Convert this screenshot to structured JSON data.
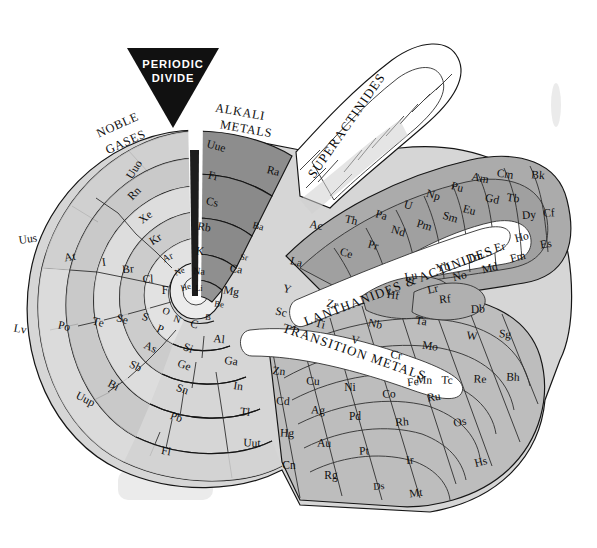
{
  "figure": {
    "divide_label_line1": "PERIODIC",
    "divide_label_line2": "DIVIDE"
  },
  "group_labels": {
    "noble_gases_line1": "NOBLE",
    "noble_gases_line2": "GASES",
    "alkali_line1": "ALKALI",
    "alkali_line2": "METALS",
    "superactinides": "SUPERACTINIDES",
    "lanthanides_actinides": "LANTHANIDES & ACTINIDES",
    "transition_metals": "TRANSITION METALS"
  },
  "colors": {
    "background": "#ffffff",
    "outline": "#151515",
    "divide_wedge": "#1a1a1a",
    "alkali_shade": "#8c8c8c",
    "noble_shade": "#cfcfcf",
    "halogen_shade": "#e2e2e2",
    "chalcogen_shade": "#b5b5b5",
    "transition_shade": "#bdbdbd",
    "lanth_shade": "#a8a8a8",
    "white_cell": "#ffffff",
    "label_band": "#ffffff"
  },
  "spiral_rings": {
    "noble_gases": [
      "Uuo",
      "Rn",
      "Xe",
      "Kr",
      "Ar",
      "Ne",
      "He"
    ],
    "alkali_metals": [
      "Uue",
      "Fr",
      "Cs",
      "Rb",
      "K",
      "Na",
      "Li"
    ],
    "halogens": [
      "Uus",
      "At",
      "I",
      "Br",
      "Cl",
      "F"
    ],
    "chalcogens": [
      "Lv",
      "Po",
      "Te",
      "Se",
      "S",
      "O"
    ],
    "pnictogens": [
      "Uup",
      "Bi",
      "Sb",
      "As",
      "P",
      "N"
    ],
    "group14": [
      "Fl",
      "Pb",
      "Sn",
      "Ge",
      "Si",
      "C"
    ],
    "group13": [
      "Uut",
      "Tl",
      "In",
      "Ga",
      "Al",
      "B"
    ],
    "alkaline_earth": [
      "Ra",
      "Ba",
      "Sr",
      "Ca",
      "Mg",
      "Be"
    ],
    "group3": [
      "Ac",
      "La",
      "Y",
      "Sc"
    ],
    "group12": [
      "Cn",
      "Hg",
      "Cd",
      "Zn"
    ],
    "group4": [
      "Rf",
      "Hf",
      "Zr",
      "Ti"
    ],
    "group11": [
      "Rg",
      "Au",
      "Ag",
      "Cu"
    ],
    "group5": [
      "Db",
      "Ta",
      "Nb",
      "V"
    ],
    "group10": [
      "Ds",
      "Pt",
      "Pd",
      "Ni"
    ],
    "group6": [
      "Sg",
      "W",
      "Mo",
      "Cr"
    ],
    "group9": [
      "Mt",
      "Ir",
      "Rh",
      "Co"
    ],
    "group7": [
      "Bh",
      "Re",
      "Tc",
      "Mn"
    ],
    "group8": [
      "Hs",
      "Os",
      "Ru",
      "Fe"
    ]
  },
  "lanthanides": [
    "La",
    "Ce",
    "Pr",
    "Nd",
    "Pm",
    "Sm",
    "Eu",
    "Gd",
    "Tb",
    "Dy",
    "Ho",
    "Er",
    "Tm",
    "Yb",
    "Lu"
  ],
  "actinides": [
    "Ac",
    "Th",
    "Pa",
    "U",
    "Np",
    "Pu",
    "Am",
    "Cm",
    "Bk",
    "Cf",
    "Es",
    "Fm",
    "Md",
    "No",
    "Lr"
  ],
  "cells": {
    "noble": [
      {
        "t": "Uuo",
        "x": 135,
        "y": 170,
        "r": -58,
        "s": ""
      },
      {
        "t": "Rn",
        "x": 135,
        "y": 194,
        "r": -46,
        "s": ""
      },
      {
        "t": "Xe",
        "x": 146,
        "y": 218,
        "r": -38,
        "s": ""
      },
      {
        "t": "Kr",
        "x": 156,
        "y": 240,
        "r": -32,
        "s": ""
      },
      {
        "t": "Ar",
        "x": 168,
        "y": 258,
        "r": -26,
        "s": "sm"
      },
      {
        "t": "Ne",
        "x": 180,
        "y": 272,
        "r": -22,
        "s": "xs"
      },
      {
        "t": "He",
        "x": 186,
        "y": 288,
        "r": -16,
        "s": "xs"
      }
    ],
    "alkali": [
      {
        "t": "Uue",
        "x": 216,
        "y": 147,
        "r": 16,
        "s": ""
      },
      {
        "t": "Fr",
        "x": 213,
        "y": 177,
        "r": 14,
        "s": ""
      },
      {
        "t": "Cs",
        "x": 212,
        "y": 203,
        "r": 12,
        "s": ""
      },
      {
        "t": "Rb",
        "x": 204,
        "y": 228,
        "r": 10,
        "s": ""
      },
      {
        "t": "K",
        "x": 200,
        "y": 252,
        "r": 6,
        "s": ""
      },
      {
        "t": "Na",
        "x": 199,
        "y": 272,
        "r": 4,
        "s": "sm"
      },
      {
        "t": "Li",
        "x": 199,
        "y": 289,
        "r": 2,
        "s": "xs"
      }
    ],
    "halogen": [
      {
        "t": "Uus",
        "x": 28,
        "y": 240,
        "r": -8,
        "s": ""
      },
      {
        "t": "At",
        "x": 70,
        "y": 258,
        "r": -10,
        "s": ""
      },
      {
        "t": "I",
        "x": 104,
        "y": 263,
        "r": -8,
        "s": ""
      },
      {
        "t": "Br",
        "x": 128,
        "y": 270,
        "r": -5,
        "s": ""
      },
      {
        "t": "Cl",
        "x": 148,
        "y": 280,
        "r": -2,
        "s": ""
      },
      {
        "t": "F",
        "x": 165,
        "y": 291,
        "r": 0,
        "s": ""
      }
    ],
    "chalc": [
      {
        "t": "Lv",
        "x": 20,
        "y": 330,
        "r": 10,
        "s": ""
      },
      {
        "t": "Po",
        "x": 64,
        "y": 327,
        "r": 12,
        "s": ""
      },
      {
        "t": "Te",
        "x": 98,
        "y": 323,
        "r": 14,
        "s": ""
      },
      {
        "t": "Se",
        "x": 122,
        "y": 320,
        "r": 16,
        "s": ""
      },
      {
        "t": "S",
        "x": 145,
        "y": 318,
        "r": 18,
        "s": ""
      },
      {
        "t": "O",
        "x": 166,
        "y": 312,
        "r": 20,
        "s": "sm"
      }
    ],
    "pnic": [
      {
        "t": "Uup",
        "x": 85,
        "y": 400,
        "r": 28,
        "s": ""
      },
      {
        "t": "Bi",
        "x": 113,
        "y": 386,
        "r": 28,
        "s": ""
      },
      {
        "t": "Sb",
        "x": 135,
        "y": 367,
        "r": 26,
        "s": ""
      },
      {
        "t": "As",
        "x": 150,
        "y": 348,
        "r": 24,
        "s": ""
      },
      {
        "t": "P",
        "x": 160,
        "y": 330,
        "r": 22,
        "s": ""
      },
      {
        "t": "N",
        "x": 177,
        "y": 320,
        "r": 20,
        "s": "sm"
      }
    ],
    "g14": [
      {
        "t": "Fl",
        "x": 166,
        "y": 452,
        "r": 10,
        "s": ""
      },
      {
        "t": "Pb",
        "x": 176,
        "y": 418,
        "r": 18,
        "s": ""
      },
      {
        "t": "Sn",
        "x": 182,
        "y": 390,
        "r": 20,
        "s": ""
      },
      {
        "t": "Ge",
        "x": 184,
        "y": 366,
        "r": 20,
        "s": ""
      },
      {
        "t": "Si",
        "x": 188,
        "y": 349,
        "r": 20,
        "s": ""
      },
      {
        "t": "C",
        "x": 194,
        "y": 325,
        "r": 14,
        "s": ""
      }
    ],
    "g13": [
      {
        "t": "Uut",
        "x": 252,
        "y": 444,
        "r": 2,
        "s": ""
      },
      {
        "t": "Tl",
        "x": 245,
        "y": 413,
        "r": 6,
        "s": ""
      },
      {
        "t": "In",
        "x": 238,
        "y": 387,
        "r": 8,
        "s": ""
      },
      {
        "t": "Ga",
        "x": 231,
        "y": 362,
        "r": 8,
        "s": ""
      },
      {
        "t": "Al",
        "x": 219,
        "y": 340,
        "r": 6,
        "s": ""
      },
      {
        "t": "B",
        "x": 208,
        "y": 318,
        "r": 4,
        "s": "xs"
      }
    ],
    "alkearth": [
      {
        "t": "Ra",
        "x": 273,
        "y": 172,
        "r": 14,
        "s": ""
      },
      {
        "t": "Ba",
        "x": 258,
        "y": 227,
        "r": 14,
        "s": "sm"
      },
      {
        "t": "Sr",
        "x": 244,
        "y": 258,
        "r": 12,
        "s": "xs"
      },
      {
        "t": "Ca",
        "x": 236,
        "y": 270,
        "r": 10,
        "s": ""
      },
      {
        "t": "Mg",
        "x": 231,
        "y": 292,
        "r": 10,
        "s": ""
      },
      {
        "t": "Be",
        "x": 219,
        "y": 305,
        "r": 8,
        "s": "xs"
      }
    ],
    "g3": [
      {
        "t": "Ac",
        "x": 316,
        "y": 226,
        "r": 12,
        "s": ""
      },
      {
        "t": "La",
        "x": 296,
        "y": 263,
        "r": 14,
        "s": ""
      },
      {
        "t": "Y",
        "x": 287,
        "y": 290,
        "r": 14,
        "s": ""
      },
      {
        "t": "Sc",
        "x": 281,
        "y": 313,
        "r": 14,
        "s": ""
      }
    ],
    "g4row": [
      {
        "t": "Th",
        "x": 351,
        "y": 221,
        "r": 12,
        "s": ""
      },
      {
        "t": "Hf",
        "x": 393,
        "y": 296,
        "r": 8,
        "s": ""
      },
      {
        "t": "Zr",
        "x": 332,
        "y": 305,
        "r": 14,
        "s": ""
      },
      {
        "t": "Ti",
        "x": 320,
        "y": 325,
        "r": 14,
        "s": ""
      }
    ],
    "g5row": [
      {
        "t": "Ta",
        "x": 421,
        "y": 322,
        "r": 8,
        "s": ""
      },
      {
        "t": "Nb",
        "x": 375,
        "y": 325,
        "r": 12,
        "s": ""
      },
      {
        "t": "V",
        "x": 355,
        "y": 341,
        "r": 12,
        "s": ""
      }
    ],
    "g6row": [
      {
        "t": "Sg",
        "x": 505,
        "y": 335,
        "r": 6,
        "s": ""
      },
      {
        "t": "W",
        "x": 472,
        "y": 337,
        "r": 6,
        "s": ""
      },
      {
        "t": "Mo",
        "x": 430,
        "y": 347,
        "r": 8,
        "s": ""
      },
      {
        "t": "Cr",
        "x": 396,
        "y": 356,
        "r": 10,
        "s": ""
      }
    ],
    "g7row": [
      {
        "t": "Bh",
        "x": 513,
        "y": 378,
        "r": 2,
        "s": ""
      },
      {
        "t": "Re",
        "x": 480,
        "y": 380,
        "r": 2,
        "s": ""
      },
      {
        "t": "Tc",
        "x": 447,
        "y": 381,
        "r": 2,
        "s": ""
      },
      {
        "t": "Mn",
        "x": 424,
        "y": 381,
        "r": 2,
        "s": ""
      }
    ],
    "g8row": [
      {
        "t": "Hs",
        "x": 481,
        "y": 463,
        "r": -14,
        "s": ""
      },
      {
        "t": "Os",
        "x": 460,
        "y": 423,
        "r": -12,
        "s": ""
      },
      {
        "t": "Ru",
        "x": 434,
        "y": 398,
        "r": -8,
        "s": ""
      },
      {
        "t": "Fe",
        "x": 413,
        "y": 383,
        "r": -6,
        "s": ""
      }
    ],
    "g9row": [
      {
        "t": "Mt",
        "x": 416,
        "y": 494,
        "r": -8,
        "s": ""
      },
      {
        "t": "Ir",
        "x": 410,
        "y": 461,
        "r": -6,
        "s": ""
      },
      {
        "t": "Rh",
        "x": 402,
        "y": 423,
        "r": -4,
        "s": ""
      },
      {
        "t": "Co",
        "x": 389,
        "y": 395,
        "r": -2,
        "s": ""
      }
    ],
    "g10row": [
      {
        "t": "Ds",
        "x": 379,
        "y": 487,
        "r": -4,
        "s": "sm"
      },
      {
        "t": "Pt",
        "x": 364,
        "y": 452,
        "r": -2,
        "s": ""
      },
      {
        "t": "Pd",
        "x": 355,
        "y": 417,
        "r": 0,
        "s": ""
      },
      {
        "t": "Ni",
        "x": 350,
        "y": 388,
        "r": 0,
        "s": ""
      }
    ],
    "g11row": [
      {
        "t": "Rg",
        "x": 331,
        "y": 476,
        "r": 0,
        "s": ""
      },
      {
        "t": "Au",
        "x": 324,
        "y": 444,
        "r": 2,
        "s": ""
      },
      {
        "t": "Ag",
        "x": 318,
        "y": 411,
        "r": 4,
        "s": ""
      },
      {
        "t": "Cu",
        "x": 313,
        "y": 382,
        "r": 4,
        "s": ""
      }
    ],
    "g12row": [
      {
        "t": "Cn",
        "x": 289,
        "y": 466,
        "r": 0,
        "s": ""
      },
      {
        "t": "Hg",
        "x": 287,
        "y": 434,
        "r": 2,
        "s": ""
      },
      {
        "t": "Cd",
        "x": 283,
        "y": 402,
        "r": 4,
        "s": ""
      },
      {
        "t": "Zn",
        "x": 279,
        "y": 372,
        "r": 6,
        "s": ""
      }
    ],
    "lanth": [
      {
        "t": "Ce",
        "x": 346,
        "y": 254,
        "r": 16,
        "s": ""
      },
      {
        "t": "Pr",
        "x": 373,
        "y": 246,
        "r": 16,
        "s": ""
      },
      {
        "t": "Nd",
        "x": 398,
        "y": 232,
        "r": 16,
        "s": ""
      },
      {
        "t": "Pm",
        "x": 424,
        "y": 226,
        "r": 16,
        "s": ""
      },
      {
        "t": "Sm",
        "x": 450,
        "y": 218,
        "r": 16,
        "s": ""
      },
      {
        "t": "Eu",
        "x": 469,
        "y": 211,
        "r": 14,
        "s": ""
      },
      {
        "t": "Gd",
        "x": 492,
        "y": 200,
        "r": 12,
        "s": ""
      },
      {
        "t": "Tb",
        "x": 513,
        "y": 199,
        "r": 8,
        "s": ""
      },
      {
        "t": "Dy",
        "x": 529,
        "y": 216,
        "r": -4,
        "s": ""
      },
      {
        "t": "Ho",
        "x": 522,
        "y": 238,
        "r": -14,
        "s": ""
      },
      {
        "t": "Er",
        "x": 500,
        "y": 248,
        "r": -14,
        "s": ""
      },
      {
        "t": "Tm",
        "x": 475,
        "y": 258,
        "r": -14,
        "s": ""
      },
      {
        "t": "Yb",
        "x": 443,
        "y": 268,
        "r": -12,
        "s": ""
      },
      {
        "t": "Lu",
        "x": 411,
        "y": 277,
        "r": -10,
        "s": ""
      }
    ],
    "actin": [
      {
        "t": "Pa",
        "x": 381,
        "y": 216,
        "r": 16,
        "s": ""
      },
      {
        "t": "U",
        "x": 408,
        "y": 206,
        "r": 16,
        "s": ""
      },
      {
        "t": "Np",
        "x": 433,
        "y": 196,
        "r": 16,
        "s": ""
      },
      {
        "t": "Pu",
        "x": 457,
        "y": 188,
        "r": 14,
        "s": ""
      },
      {
        "t": "Am",
        "x": 480,
        "y": 179,
        "r": 12,
        "s": ""
      },
      {
        "t": "Cm",
        "x": 505,
        "y": 175,
        "r": 8,
        "s": ""
      },
      {
        "t": "Bk",
        "x": 538,
        "y": 176,
        "r": 4,
        "s": ""
      },
      {
        "t": "Cf",
        "x": 549,
        "y": 214,
        "r": -4,
        "s": ""
      },
      {
        "t": "Es",
        "x": 546,
        "y": 245,
        "r": -10,
        "s": ""
      },
      {
        "t": "Fm",
        "x": 518,
        "y": 258,
        "r": -14,
        "s": ""
      },
      {
        "t": "Md",
        "x": 490,
        "y": 269,
        "r": -14,
        "s": ""
      },
      {
        "t": "No",
        "x": 460,
        "y": 277,
        "r": -14,
        "s": ""
      },
      {
        "t": "Lr",
        "x": 433,
        "y": 290,
        "r": -12,
        "s": ""
      },
      {
        "t": "Rf",
        "x": 445,
        "y": 300,
        "r": -6,
        "s": ""
      },
      {
        "t": "Db",
        "x": 478,
        "y": 310,
        "r": -2,
        "s": ""
      }
    ]
  }
}
